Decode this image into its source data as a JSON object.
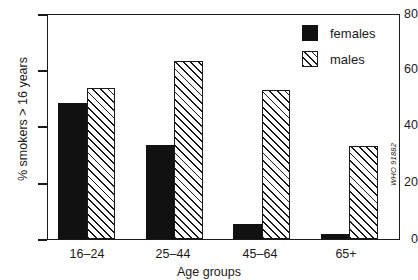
{
  "chart_data": {
    "type": "bar",
    "title": "",
    "xlabel": "Age groups",
    "ylabel": "% smokers > 16 years",
    "categories": [
      "16–24",
      "25–44",
      "45–64",
      "65+"
    ],
    "series": [
      {
        "name": "females",
        "values": [
          48.5,
          33.5,
          5.3,
          1.8
        ],
        "color": "#111111",
        "fill": "solid"
      },
      {
        "name": "males",
        "values": [
          53.8,
          63.5,
          53.3,
          33.2
        ],
        "color": "#1a1a1a",
        "fill": "diagonal-hatch"
      }
    ],
    "ylim": [
      0,
      80
    ],
    "yticks": [
      0,
      20,
      40,
      60,
      80
    ],
    "ytick_labels": [
      "0",
      "20",
      "40",
      "60",
      "80"
    ],
    "grid": false,
    "legend_position": "top-right",
    "legend": [
      "females",
      "males"
    ]
  },
  "axes": {
    "y_title": "% smokers > 16 years",
    "x_title": "Age groups",
    "y_tick_labels": [
      "80",
      "60",
      "40",
      "20",
      "0"
    ],
    "x_tick_labels": [
      "16–24",
      "25–44",
      "45–64",
      "65+"
    ]
  },
  "legend": {
    "items": [
      {
        "label": "females",
        "swatch": "solid-black-square"
      },
      {
        "label": "males",
        "swatch": "hatched-square"
      }
    ]
  },
  "credit": {
    "text": "WHO 91882"
  }
}
